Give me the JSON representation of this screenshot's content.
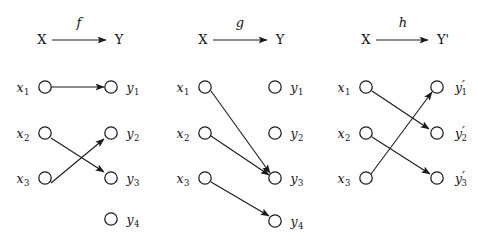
{
  "figure": {
    "background_color": "#ffffff",
    "ink_color": "#1a1a1a",
    "width": 478,
    "height": 249
  },
  "panels": [
    {
      "id": "panel-f",
      "header": {
        "domain": "X",
        "codomain": "Y",
        "map_name": "f",
        "arrow": "right-arrow"
      },
      "domain_nodes": [
        {
          "id": "x1",
          "base": "x",
          "sub": "1",
          "prime": ""
        },
        {
          "id": "x2",
          "base": "x",
          "sub": "2",
          "prime": ""
        },
        {
          "id": "x3",
          "base": "x",
          "sub": "3",
          "prime": ""
        }
      ],
      "codomain_nodes": [
        {
          "id": "y1",
          "base": "y",
          "sub": "1",
          "prime": ""
        },
        {
          "id": "y2",
          "base": "y",
          "sub": "2",
          "prime": ""
        },
        {
          "id": "y3",
          "base": "y",
          "sub": "3",
          "prime": ""
        },
        {
          "id": "y4",
          "base": "y",
          "sub": "4",
          "prime": ""
        }
      ],
      "edges": [
        {
          "from": "x1",
          "to": "y1"
        },
        {
          "from": "x2",
          "to": "y3"
        },
        {
          "from": "x3",
          "to": "y2"
        }
      ],
      "unmapped_codomain": [
        "y2-is-hit",
        "y4"
      ]
    },
    {
      "id": "panel-g",
      "header": {
        "domain": "X",
        "codomain": "Y",
        "map_name": "g",
        "arrow": "right-arrow"
      },
      "domain_nodes": [
        {
          "id": "x1",
          "base": "x",
          "sub": "1",
          "prime": ""
        },
        {
          "id": "x2",
          "base": "x",
          "sub": "2",
          "prime": ""
        },
        {
          "id": "x3",
          "base": "x",
          "sub": "3",
          "prime": ""
        }
      ],
      "codomain_nodes": [
        {
          "id": "y1",
          "base": "y",
          "sub": "1",
          "prime": ""
        },
        {
          "id": "y2",
          "base": "y",
          "sub": "2",
          "prime": ""
        },
        {
          "id": "y3",
          "base": "y",
          "sub": "3",
          "prime": ""
        },
        {
          "id": "y4",
          "base": "y",
          "sub": "4",
          "prime": ""
        }
      ],
      "edges": [
        {
          "from": "x1",
          "to": "y3"
        },
        {
          "from": "x2",
          "to": "y3"
        },
        {
          "from": "x3",
          "to": "y4"
        }
      ],
      "unmapped_codomain": [
        "y1",
        "y2"
      ]
    },
    {
      "id": "panel-h",
      "header": {
        "domain": "X",
        "codomain": "Y'",
        "map_name": "h",
        "arrow": "right-arrow"
      },
      "domain_nodes": [
        {
          "id": "x1",
          "base": "x",
          "sub": "1",
          "prime": ""
        },
        {
          "id": "x2",
          "base": "x",
          "sub": "2",
          "prime": ""
        },
        {
          "id": "x3",
          "base": "x",
          "sub": "3",
          "prime": ""
        }
      ],
      "codomain_nodes": [
        {
          "id": "y1p",
          "base": "y",
          "sub": "1",
          "prime": "′"
        },
        {
          "id": "y2p",
          "base": "y",
          "sub": "2",
          "prime": "′"
        },
        {
          "id": "y3p",
          "base": "y",
          "sub": "3",
          "prime": "′"
        }
      ],
      "edges": [
        {
          "from": "x1",
          "to": "y2p"
        },
        {
          "from": "x2",
          "to": "y3p"
        },
        {
          "from": "x3",
          "to": "y1p"
        }
      ],
      "unmapped_codomain": []
    }
  ]
}
